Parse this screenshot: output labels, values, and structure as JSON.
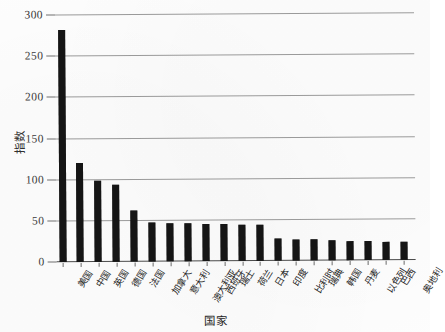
{
  "chart_data": {
    "type": "bar",
    "title": "",
    "xlabel": "国家",
    "ylabel": "指数",
    "ylim": [
      0,
      300
    ],
    "yticks": [
      0,
      50,
      100,
      150,
      200,
      250,
      300
    ],
    "grid": true,
    "legend": false,
    "orientation": "vertical",
    "bar_color": "#151515",
    "categories": [
      "美国",
      "中国",
      "英国",
      "德国",
      "法国",
      "加拿大",
      "意大利",
      "澳大利亚",
      "西班牙",
      "瑞士",
      "荷兰",
      "日本",
      "印度",
      "比利时",
      "瑞典",
      "韩国",
      "丹麦",
      "以色列",
      "巴西",
      "奥地利"
    ],
    "values": [
      282,
      120,
      98,
      93,
      62,
      47,
      46,
      46,
      45,
      45,
      44,
      44,
      27,
      26,
      25,
      24,
      23,
      23,
      22,
      22
    ]
  },
  "axes": {
    "y_tick_labels": [
      "300",
      "250",
      "200",
      "150",
      "100",
      "50",
      "0"
    ],
    "y_title": "指数",
    "x_title": "国家"
  },
  "colors": {
    "bar": "#151515",
    "gridline": "#9a9a9a",
    "axis": "#4a4a4a",
    "background": "#fdfdfd",
    "text": "#242424"
  }
}
